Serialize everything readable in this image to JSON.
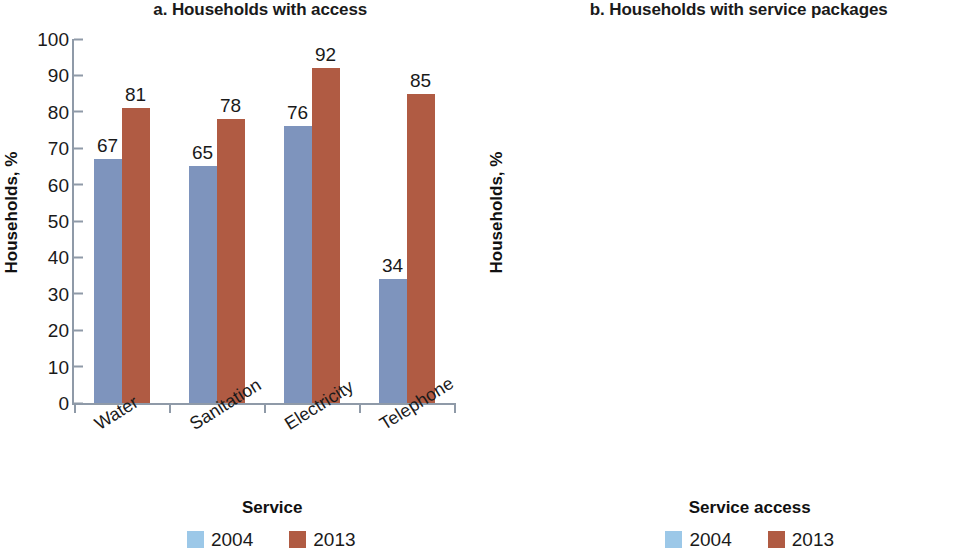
{
  "figure": {
    "width": 969,
    "height": 560,
    "background": "#ffffff"
  },
  "colors": {
    "series_2004_bar": "#7e94bd",
    "series_2004_legend": "#9cc8e8",
    "series_2013": "#b05b43",
    "axis": "#8f9aa8",
    "text": "#1a1a1a"
  },
  "panels": [
    {
      "id": "panel-a",
      "title": "a. Households with access",
      "ylabel": "Households, %",
      "xlabel": "Service",
      "legend": [
        {
          "label": "2004",
          "color": "#9cc8e8"
        },
        {
          "label": "2013",
          "color": "#b05b43"
        }
      ]
    },
    {
      "id": "panel-b",
      "title": "b. Households with service packages",
      "ylabel": "Households, %",
      "xlabel": "Service access",
      "legend": [
        {
          "label": "2004",
          "color": "#9cc8e8"
        },
        {
          "label": "2013",
          "color": "#b05b43"
        }
      ]
    }
  ],
  "chart_data": [
    {
      "id": "a",
      "type": "bar",
      "title": "a. Households with access",
      "xlabel": "Service",
      "ylabel": "Households, %",
      "ylim": [
        0,
        100
      ],
      "yticks": [
        0,
        10,
        20,
        30,
        40,
        50,
        60,
        70,
        80,
        90,
        100
      ],
      "ytick_labels": [
        "0",
        "10",
        "20",
        "30",
        "40",
        "50",
        "60",
        "70",
        "80",
        "90",
        "100"
      ],
      "grid": false,
      "legend_position": "bottom",
      "categories": [
        "Water",
        "Sanitation",
        "Electricity",
        "Telephone"
      ],
      "series": [
        {
          "name": "2004",
          "color": "#7e94bd",
          "values": [
            67,
            65,
            76,
            34
          ]
        },
        {
          "name": "2013",
          "color": "#b05b43",
          "values": [
            81,
            78,
            92,
            85
          ]
        }
      ],
      "data_labels": {
        "2004": [
          "67",
          "65",
          "76",
          "34"
        ],
        "2013": [
          "81",
          "78",
          "92",
          "85"
        ]
      }
    },
    {
      "id": "b",
      "type": "bar",
      "title": "b. Households with service packages",
      "xlabel": "Service access",
      "ylabel": "Households, %",
      "ylim": [
        0,
        70
      ],
      "yticks": [
        0,
        10,
        20,
        30,
        40,
        50,
        60,
        70
      ],
      "ytick_labels": [
        "0",
        "10",
        "20",
        "30",
        "40",
        "50",
        "60",
        "70"
      ],
      "grid": false,
      "legend_position": "bottom",
      "categories": [
        "0 services",
        "1 service",
        "2 services",
        "3 services",
        "4 services"
      ],
      "series": [
        {
          "name": "2004",
          "color": "#7e94bd",
          "values": [
            15,
            15,
            14,
            26,
            30
          ]
        },
        {
          "name": "2013",
          "color": "#b05b43",
          "values": [
            2,
            5,
            11,
            18,
            64
          ]
        }
      ],
      "data_labels": {
        "2004": [
          "15",
          "15",
          "14",
          "26",
          "30"
        ],
        "2013": [
          "2",
          "5",
          "11",
          "18",
          "64"
        ]
      }
    }
  ]
}
